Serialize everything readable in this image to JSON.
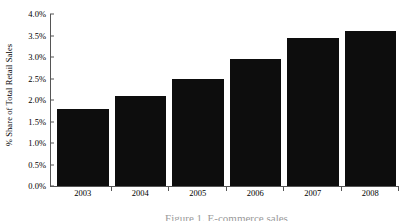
{
  "chart_data": {
    "type": "bar",
    "title": "",
    "xlabel": "",
    "ylabel": "% Share of Total Retail Sales",
    "categories": [
      "2003",
      "2004",
      "2005",
      "2006",
      "2007",
      "2008"
    ],
    "values": [
      1.8,
      2.1,
      2.5,
      2.95,
      3.45,
      3.6
    ],
    "value_labels": [
      "1.8%",
      "2.1%",
      "2.5%",
      "2.95%",
      "3.45%",
      "3.6%"
    ],
    "ylim": [
      0.0,
      4.0
    ],
    "ytick_values": [
      0.0,
      0.5,
      1.0,
      1.5,
      2.0,
      2.5,
      3.0,
      3.5,
      4.0
    ],
    "ytick_labels": [
      "0.0%",
      "0.5%",
      "1.0%",
      "1.5%",
      "2.0%",
      "2.5%",
      "3.0%",
      "3.5%",
      "4.0%"
    ],
    "grid": false,
    "legend": null,
    "bar_color": "#0d0d0d",
    "axis_color": "#555555",
    "background": "#ffffff"
  },
  "caption": {
    "text": "Figure 1. E-commerce sales"
  }
}
